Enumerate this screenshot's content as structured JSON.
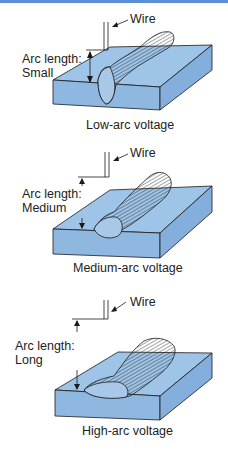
{
  "colors": {
    "plate_top": "#9ec4e8",
    "plate_side": "#8fb8e0",
    "bead": "#a9c8e8",
    "stroke": "#1a1a1a",
    "top_border": "#5b8fd6"
  },
  "panels": [
    {
      "wire_label": "Wire",
      "arc_label_line1": "Arc length:",
      "arc_label_line2": "Small",
      "caption": "Low-arc voltage"
    },
    {
      "wire_label": "Wire",
      "arc_label_line1": "Arc length:",
      "arc_label_line2": "Medium",
      "caption": "Medium-arc voltage"
    },
    {
      "wire_label": "Wire",
      "arc_label_line1": "Arc length:",
      "arc_label_line2": "Long",
      "caption": "High-arc voltage"
    }
  ]
}
